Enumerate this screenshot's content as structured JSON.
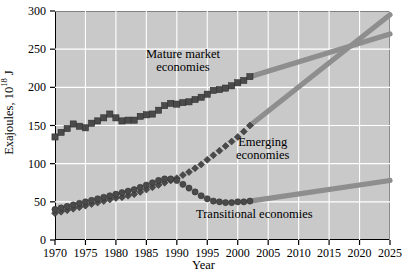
{
  "chart_data": {
    "type": "line",
    "title": "",
    "xlabel": "Year",
    "ylabel": "Exajoules, 10^18 J",
    "ylabel_prefix": "Exajoules, 10",
    "ylabel_exponent": "18",
    "ylabel_suffix": " J",
    "xlim": [
      1970,
      2025
    ],
    "ylim": [
      0,
      300
    ],
    "xticks": [
      1970,
      1975,
      1980,
      1985,
      1990,
      1995,
      2000,
      2005,
      2010,
      2015,
      2020,
      2025
    ],
    "yticks": [
      0,
      50,
      100,
      150,
      200,
      250,
      300
    ],
    "grid": true,
    "legend_position": "inline-annotations",
    "plot_background": "#c9c9c9",
    "grid_color": "#ffffff",
    "marker_color": "#4a4a4a",
    "projection_color": "#8e8e8e",
    "series": [
      {
        "name": "Mature market economies",
        "marker": "square",
        "annotation": "Mature market\neconomies",
        "annotation_line1": "Mature market",
        "annotation_line2": "economies",
        "x": [
          1970,
          1971,
          1972,
          1973,
          1974,
          1975,
          1976,
          1977,
          1978,
          1979,
          1980,
          1981,
          1982,
          1983,
          1984,
          1985,
          1986,
          1987,
          1988,
          1989,
          1990,
          1991,
          1992,
          1993,
          1994,
          1995,
          1996,
          1997,
          1998,
          1999,
          2000,
          2001,
          2002
        ],
        "y": [
          135,
          141,
          146,
          152,
          149,
          147,
          153,
          156,
          160,
          165,
          160,
          156,
          157,
          157,
          162,
          164,
          165,
          170,
          176,
          179,
          178,
          180,
          181,
          184,
          187,
          191,
          196,
          197,
          199,
          202,
          206,
          209,
          214
        ],
        "projection_x": [
          2002,
          2025
        ],
        "projection_y": [
          214,
          270
        ]
      },
      {
        "name": "Emerging economies",
        "marker": "diamond",
        "annotation": "Emerging\neconomies",
        "annotation_line1": "Emerging",
        "annotation_line2": "economies",
        "x": [
          1970,
          1971,
          1972,
          1973,
          1974,
          1975,
          1976,
          1977,
          1978,
          1979,
          1980,
          1981,
          1982,
          1983,
          1984,
          1985,
          1986,
          1987,
          1988,
          1989,
          1990,
          1991,
          1992,
          1993,
          1994,
          1995,
          1996,
          1997,
          1998,
          1999,
          2000,
          2001,
          2002
        ],
        "y": [
          35,
          37,
          39,
          41,
          43,
          45,
          47,
          49,
          51,
          53,
          55,
          56,
          58,
          60,
          63,
          66,
          69,
          72,
          75,
          78,
          81,
          85,
          89,
          94,
          99,
          105,
          111,
          117,
          123,
          129,
          135,
          142,
          150
        ],
        "projection_x": [
          2002,
          2025
        ],
        "projection_y": [
          150,
          295
        ]
      },
      {
        "name": "Transitional economies",
        "marker": "circle",
        "annotation": "Transitional economies",
        "annotation_line1": "Transitional economies",
        "annotation_line2": "",
        "x": [
          1970,
          1971,
          1972,
          1973,
          1974,
          1975,
          1976,
          1977,
          1978,
          1979,
          1980,
          1981,
          1982,
          1983,
          1984,
          1985,
          1986,
          1987,
          1988,
          1989,
          1990,
          1991,
          1992,
          1993,
          1994,
          1995,
          1996,
          1997,
          1998,
          1999,
          2000,
          2001,
          2002
        ],
        "y": [
          40,
          42,
          44,
          46,
          48,
          50,
          52,
          54,
          56,
          58,
          60,
          62,
          64,
          66,
          69,
          72,
          75,
          78,
          80,
          80,
          78,
          73,
          68,
          63,
          58,
          54,
          51,
          50,
          49,
          49,
          50,
          50,
          51
        ],
        "projection_x": [
          2002,
          2025
        ],
        "projection_y": [
          51,
          78
        ]
      }
    ]
  },
  "axes": {
    "ytick_labels": [
      "300",
      "250",
      "200",
      "150",
      "100",
      "50",
      "0"
    ],
    "xtick_labels": [
      "1970",
      "1975",
      "1980",
      "1985",
      "1990",
      "1995",
      "2000",
      "2005",
      "2010",
      "2015",
      "2020",
      "2025"
    ],
    "y_title_prefix": "Exajoules, 10",
    "y_title_exponent": "18",
    "y_title_suffix": " J",
    "x_title": "Year"
  }
}
